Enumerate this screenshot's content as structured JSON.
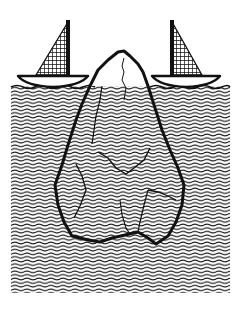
{
  "illustration": {
    "subject": "iceberg with two sailboats",
    "colors": {
      "ink": "#111111",
      "paper": "#ffffff"
    },
    "elements": [
      "left-sailboat",
      "right-sailboat",
      "iceberg",
      "water"
    ]
  }
}
